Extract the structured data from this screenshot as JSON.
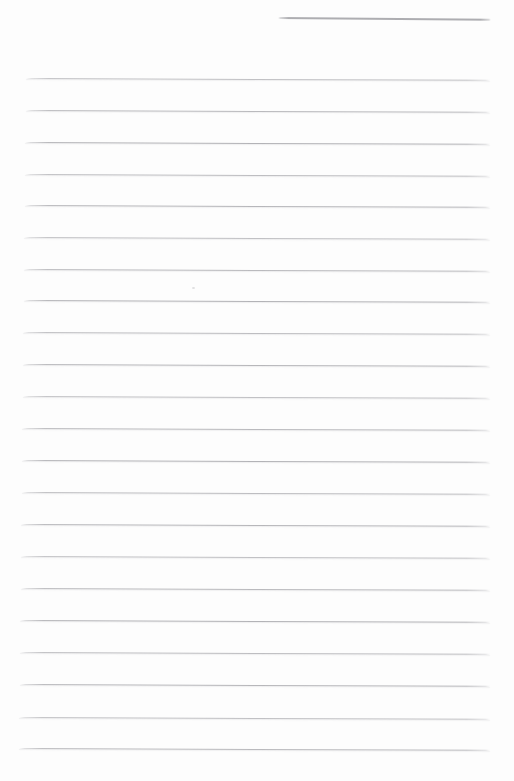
{
  "page": {
    "width": 514,
    "height": 781,
    "background_color": "#fdfdfd",
    "kind": "blank-ruled-notebook-paper"
  },
  "header_line": {
    "x1": 278,
    "x2": 491,
    "y": 18,
    "color": "#a9a9ad",
    "tilt_deg": 0.45
  },
  "ruled_lines": {
    "color": "#b0b0b4",
    "right_x": 490,
    "left_x_first": 26,
    "left_x_last": 19,
    "tilt_deg": 0.22,
    "ys": [
      79,
      111,
      143,
      175,
      206,
      238,
      270,
      301,
      333,
      365,
      397,
      429,
      461,
      493,
      525,
      557,
      589,
      621,
      653,
      685,
      718,
      749
    ]
  },
  "artifacts": {
    "speck": {
      "x": 192,
      "y": 287,
      "color": "#c6c6ca"
    }
  }
}
